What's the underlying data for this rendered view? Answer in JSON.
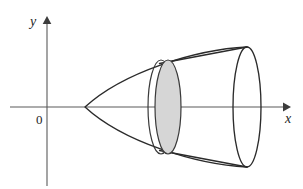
{
  "figure": {
    "type": "geometry-diagram",
    "canvas": {
      "width": 303,
      "height": 189,
      "background": "#ffffff"
    },
    "axes": {
      "x_axis": {
        "label": "x",
        "y_pixel": 107,
        "x_start": 10,
        "x_end": 287,
        "has_arrow": true,
        "color": "#5a5a5a"
      },
      "y_axis": {
        "label": "y",
        "x_pixel": 47,
        "y_start": 185,
        "y_end": 20,
        "has_arrow": true,
        "color": "#5a5a5a"
      },
      "origin": {
        "label": "0",
        "x_pixel": 47,
        "y_pixel": 107
      }
    },
    "shapes": {
      "paraboloid": {
        "name": "paraboloid-outline",
        "vertex": {
          "x": 85,
          "y": 107
        },
        "right_edge_top": {
          "x": 247,
          "y": 47
        },
        "right_edge_bottom": {
          "x": 247,
          "y": 167
        },
        "stroke": "#2b2b2b"
      },
      "end_disk": {
        "name": "right-end-ellipse",
        "center": {
          "x": 247,
          "y": 107
        },
        "rx": 14,
        "ry": 60,
        "fill": "none",
        "stroke": "#2b2b2b"
      },
      "cone": {
        "name": "inscribed-cone",
        "upper_edge": {
          "x1": 160,
          "y1": 63,
          "x2": 247,
          "y2": 47
        },
        "lower_edge": {
          "x1": 160,
          "y1": 151,
          "x2": 247,
          "y2": 167
        },
        "stroke": "#2b2b2b"
      },
      "cross_section_shaded": {
        "name": "shaded-cross-section-disk",
        "center": {
          "x": 168,
          "y": 107
        },
        "rx": 13,
        "ry": 47,
        "fill": "#d6d6d6",
        "stroke": "#3a3a3a"
      },
      "cross_section_ghost": {
        "name": "cross-section-back-ellipse",
        "center": {
          "x": 161,
          "y": 107
        },
        "rx": 13,
        "ry": 47,
        "fill": "none",
        "stroke": "#3a3a3a"
      }
    },
    "colors": {
      "ink": "#2b2b2b",
      "axis": "#5a5a5a",
      "shade": "#d6d6d6",
      "background": "#ffffff"
    }
  }
}
